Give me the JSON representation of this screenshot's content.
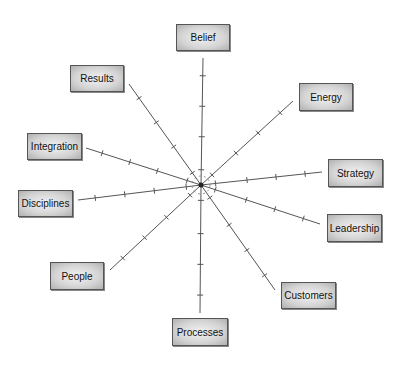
{
  "diagram": {
    "center": [
      201,
      185
    ],
    "line_color": "#555555",
    "nodes": [
      {
        "label": "Belief",
        "x": 176,
        "y": 24,
        "w": 54,
        "h": 27,
        "end": [
          203,
          58
        ]
      },
      {
        "label": "Energy",
        "x": 299,
        "y": 83,
        "w": 54,
        "h": 27,
        "end": [
          293,
          101
        ]
      },
      {
        "label": "Strategy",
        "x": 328,
        "y": 159,
        "w": 55,
        "h": 27,
        "end": [
          322,
          172
        ]
      },
      {
        "label": "Leadership",
        "x": 327,
        "y": 214,
        "w": 55,
        "h": 28,
        "end": [
          320,
          224
        ]
      },
      {
        "label": "Customers",
        "x": 281,
        "y": 282,
        "w": 55,
        "h": 27,
        "end": [
          275,
          290
        ]
      },
      {
        "label": "Processes",
        "x": 172,
        "y": 318,
        "w": 56,
        "h": 28,
        "end": [
          200,
          313
        ]
      },
      {
        "label": "People",
        "x": 50,
        "y": 262,
        "w": 54,
        "h": 28,
        "end": [
          110,
          270
        ]
      },
      {
        "label": "Disciplines",
        "x": 18,
        "y": 190,
        "w": 55,
        "h": 27,
        "end": [
          78,
          200
        ]
      },
      {
        "label": "Integration",
        "x": 27,
        "y": 133,
        "w": 55,
        "h": 27,
        "end": [
          86,
          148
        ]
      },
      {
        "label": "Results",
        "x": 70,
        "y": 65,
        "w": 54,
        "h": 27,
        "end": [
          129,
          84
        ]
      }
    ]
  }
}
